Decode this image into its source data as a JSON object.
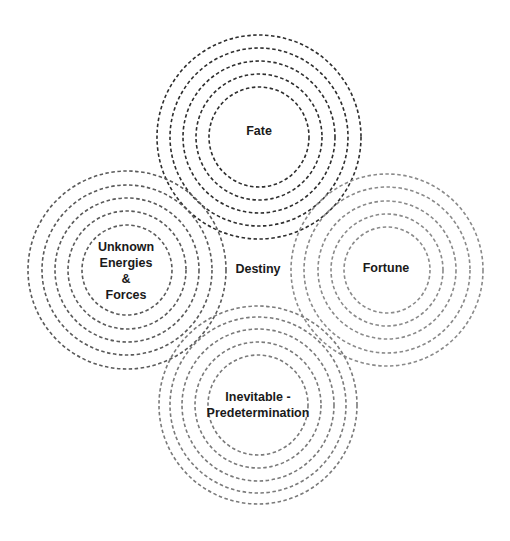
{
  "diagram": {
    "title": "",
    "center_label": "Destiny",
    "clusters": [
      {
        "id": "fate",
        "label_lines": [
          "Fate"
        ],
        "cx": 259,
        "cy": 137,
        "color": "#2e2e2e",
        "radii": [
          50,
          63,
          76,
          89,
          102
        ]
      },
      {
        "id": "unknown",
        "label_lines": [
          "Unknown",
          "Energies",
          "&",
          "Forces"
        ],
        "cx": 127,
        "cy": 270,
        "color": "#5a5a5a",
        "radii": [
          45,
          59,
          72,
          85,
          99
        ]
      },
      {
        "id": "fortune",
        "label_lines": [
          "Fortune"
        ],
        "cx": 387,
        "cy": 270,
        "color": "#8a8a8a",
        "radii": [
          43,
          56,
          69,
          83,
          96
        ]
      },
      {
        "id": "inevitable",
        "label_lines": [
          "Inevitable -",
          "Predetermination"
        ],
        "cx": 258,
        "cy": 405,
        "color": "#7a7a7a",
        "radii": [
          50,
          63,
          76,
          88,
          99
        ]
      }
    ],
    "labels": {
      "fate": "Fate",
      "unknown_1": "Unknown",
      "unknown_2": "Energies",
      "unknown_3": "&",
      "unknown_4": "Forces",
      "fortune": "Fortune",
      "destiny": "Destiny",
      "inevitable_1": "Inevitable -",
      "inevitable_2": "Predetermination"
    }
  }
}
